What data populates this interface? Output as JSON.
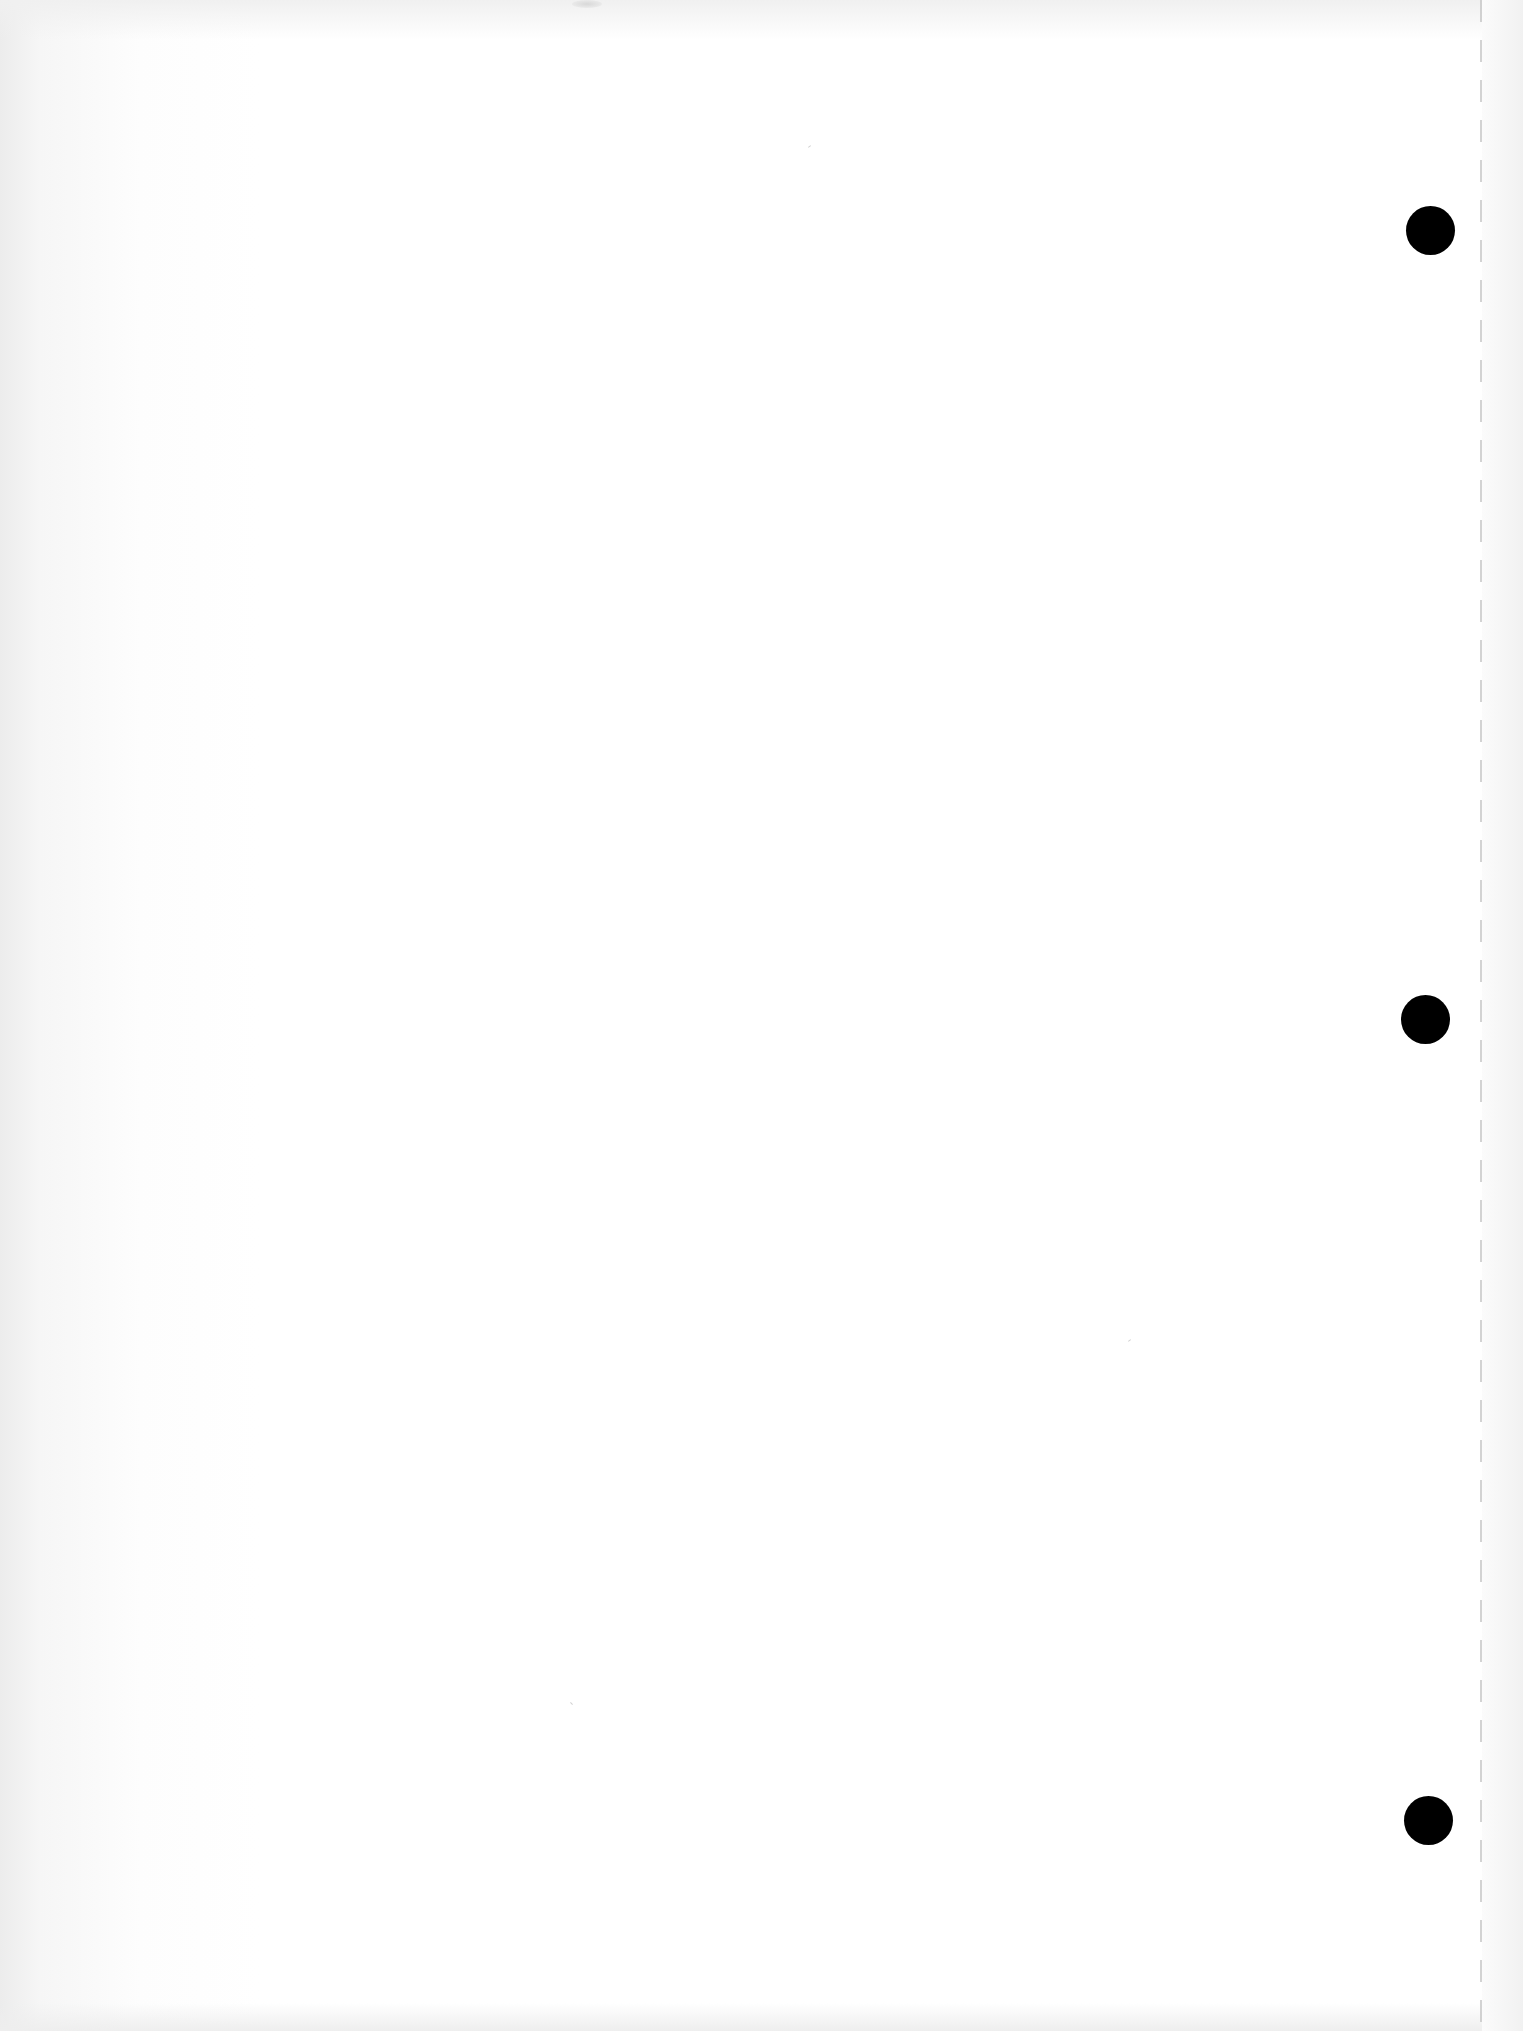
{
  "page": {
    "type": "blank scanned sheet",
    "paper_color": "#ffffff",
    "hole_color": "#000000",
    "perforation_color": "#c8c8c8",
    "text_content": ""
  },
  "punch_holes": [
    {
      "name": "top"
    },
    {
      "name": "middle"
    },
    {
      "name": "bottom"
    }
  ],
  "perforation": {
    "style": "dashed"
  }
}
